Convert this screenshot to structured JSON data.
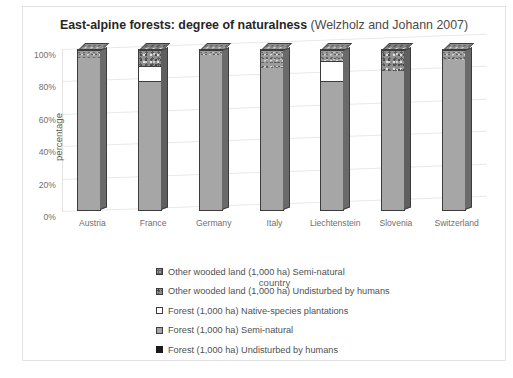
{
  "chart_data": {
    "type": "bar",
    "title_bold": "East-alpine forests: degree of naturalness",
    "title_normal": " (Welzholz and Johann 2007)",
    "title": "East-alpine forests: degree of naturalness (Welzholz and Johann 2007)",
    "xlabel": "country",
    "ylabel": "percentage",
    "ylim": [
      0,
      100
    ],
    "ytick_labels": [
      "0%",
      "20%",
      "40%",
      "60%",
      "80%",
      "100%"
    ],
    "ytick_values": [
      0,
      20,
      40,
      60,
      80,
      100
    ],
    "grid": true,
    "stacked": true,
    "legend_position": "bottom",
    "categories": [
      "Austria",
      "France",
      "Germany",
      "Italy",
      "Liechtenstein",
      "Slovenia",
      "Switzerland"
    ],
    "series": [
      {
        "name": "Forest (1,000 ha) Undisturbed by humans",
        "style": "undist",
        "values": [
          0,
          0,
          0,
          0,
          0,
          0,
          0
        ]
      },
      {
        "name": "Forest (1,000 ha) Semi-natural",
        "style": "semi",
        "values": [
          95,
          80,
          97,
          89,
          80,
          87,
          94
        ]
      },
      {
        "name": "Forest (1,000 ha) Native-species plantations",
        "style": "native",
        "values": [
          0,
          10,
          0,
          0,
          13,
          0,
          0
        ]
      },
      {
        "name": "Other wooded land (1,000 ha) Undisturbed by humans",
        "style": "owl-undist",
        "values": [
          0,
          10,
          0,
          0,
          0,
          13,
          0
        ]
      },
      {
        "name": "Other wooded land (1,000 ha) Semi-natural",
        "style": "owl-semi",
        "values": [
          5,
          0,
          3,
          11,
          7,
          0,
          6
        ]
      }
    ],
    "legend": [
      {
        "label": "Other wooded land (1,000 ha) Semi-natural",
        "style": "owl-semi"
      },
      {
        "label": "Other wooded land (1,000 ha) Undisturbed by humans",
        "style": "owl-undist"
      },
      {
        "label": "Forest (1,000 ha) Native-species plantations",
        "style": "native"
      },
      {
        "label": "Forest (1,000 ha) Semi-natural",
        "style": "semi"
      },
      {
        "label": "Forest (1,000 ha) Undisturbed by humans",
        "style": "undist"
      }
    ]
  }
}
